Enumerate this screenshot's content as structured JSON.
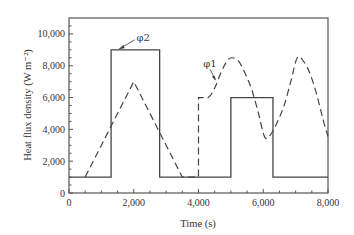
{
  "chart_data": {
    "type": "line",
    "title": "",
    "xlabel": "Time (s)",
    "ylabel": "Heat flux density (W m⁻²)",
    "xlim": [
      0,
      8000
    ],
    "ylim": [
      0,
      11000
    ],
    "x_ticks": [
      0,
      2000,
      4000,
      6000,
      8000
    ],
    "x_tick_labels": [
      "0",
      "2,000",
      "4,000",
      "6,000",
      "8,000"
    ],
    "y_ticks": [
      0,
      2000,
      4000,
      6000,
      8000,
      10000
    ],
    "y_tick_labels": [
      "0",
      "2,000",
      "4,000",
      "6,000",
      "8,000",
      "10,000"
    ],
    "grid": false,
    "legend": "none",
    "series": [
      {
        "name": "φ2",
        "style": "solid",
        "x": [
          0,
          1300,
          1300,
          2800,
          2800,
          5000,
          5000,
          6300,
          6300,
          8000
        ],
        "y": [
          1000,
          1000,
          9000,
          9000,
          1000,
          1000,
          6000,
          6000,
          1000,
          1000
        ]
      },
      {
        "name": "φ1",
        "style": "dashed",
        "x": [
          500,
          2000,
          3500,
          4000,
          4000,
          4000,
          4300,
          4500,
          4700,
          4900,
          5050,
          5250,
          5450,
          5650,
          5850,
          6050,
          6250,
          6450,
          6650,
          6850,
          7050,
          7250,
          7450,
          7650,
          7850,
          8000
        ],
        "y": [
          1000,
          7000,
          1000,
          1000,
          1000,
          6000,
          6000,
          6600,
          7600,
          8350,
          8500,
          8260,
          7470,
          6470,
          5030,
          3500,
          3740,
          4530,
          5530,
          7000,
          8500,
          8260,
          7470,
          6200,
          4600,
          3550
        ]
      }
    ],
    "annotations": [
      {
        "text": "φ2",
        "target_series": "φ2",
        "at": [
          1500,
          9000
        ]
      },
      {
        "text": "φ1",
        "target_series": "φ1",
        "at": [
          4550,
          7000
        ]
      }
    ]
  }
}
